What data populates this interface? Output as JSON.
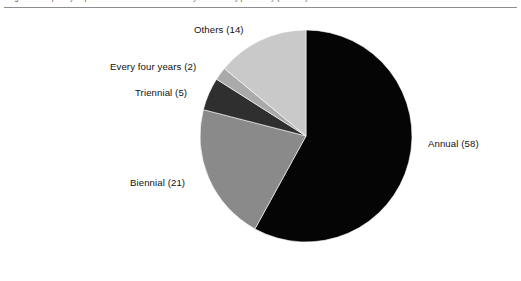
{
  "figure": {
    "caption": "Figure 1  Frequency of publication of national statistical yearbooks by periodicity (n = 100)",
    "background_color": "#ffffff",
    "rule_color": "#8d8d8d"
  },
  "chart_data": {
    "type": "pie",
    "title": "",
    "xlabel": "",
    "ylabel": "",
    "total": 100,
    "units": "count",
    "legend_position": "none",
    "labels_outside": true,
    "start_angle_deg": 0,
    "direction": "clockwise",
    "categories": [
      "Annual",
      "Biennial",
      "Triennial",
      "Every four years",
      "Others"
    ],
    "values": [
      58,
      21,
      5,
      2,
      14
    ],
    "colors": [
      "#050505",
      "#8a8a8a",
      "#2f2f2f",
      "#aaaaaa",
      "#c9c9c9"
    ],
    "slices": [
      {
        "label": "Annual",
        "value": 58,
        "text": "Annual  (58)",
        "color": "#050505",
        "start_deg": 0.0,
        "end_deg": 208.8
      },
      {
        "label": "Biennial",
        "value": 21,
        "text": "Biennial  (21)",
        "color": "#8a8a8a",
        "start_deg": 208.8,
        "end_deg": 284.4
      },
      {
        "label": "Triennial",
        "value": 5,
        "text": "Triennial  (5)",
        "color": "#2f2f2f",
        "start_deg": 284.4,
        "end_deg": 302.4
      },
      {
        "label": "Every four years",
        "value": 2,
        "text": "Every four years  (2)",
        "color": "#aaaaaa",
        "start_deg": 302.4,
        "end_deg": 309.6
      },
      {
        "label": "Others",
        "value": 14,
        "text": "Others  (14)",
        "color": "#c9c9c9",
        "start_deg": 309.6,
        "end_deg": 360.0
      }
    ],
    "geometry": {
      "cx": 306,
      "cy": 136,
      "r": 106
    }
  }
}
